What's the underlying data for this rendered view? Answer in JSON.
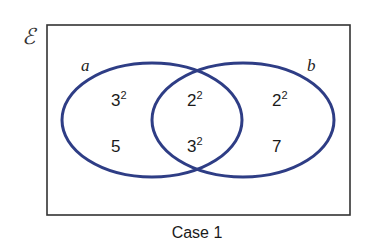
{
  "diagram": {
    "universe_symbol": "ℰ",
    "caption": "Case 1",
    "sets": [
      {
        "label": "a",
        "color": "#2e3d85"
      },
      {
        "label": "b",
        "color": "#2e3d85"
      }
    ],
    "regions": {
      "a_only": [
        {
          "base": "3",
          "exp": "2"
        },
        {
          "base": "5",
          "exp": ""
        }
      ],
      "a_and_b": [
        {
          "base": "2",
          "exp": "2"
        },
        {
          "base": "3",
          "exp": "2"
        }
      ],
      "b_only": [
        {
          "base": "2",
          "exp": "2"
        },
        {
          "base": "7",
          "exp": ""
        }
      ]
    },
    "colors": {
      "ellipse_stroke": "#2e3d85",
      "frame_stroke": "#333333",
      "text": "#1a1a1a"
    }
  }
}
